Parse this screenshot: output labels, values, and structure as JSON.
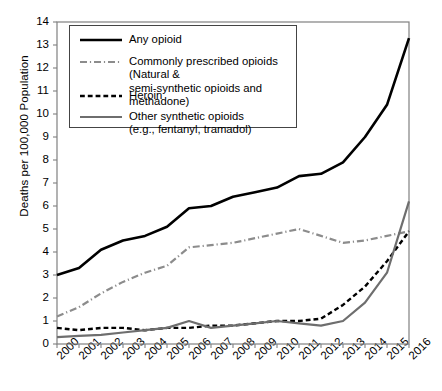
{
  "chart_data": {
    "type": "line",
    "title": "",
    "xlabel": "",
    "ylabel": "Deaths per 100,000 Population",
    "x": [
      2000,
      2001,
      2002,
      2003,
      2004,
      2005,
      2006,
      2007,
      2008,
      2009,
      2010,
      2011,
      2012,
      2013,
      2014,
      2015,
      2016
    ],
    "categories": [
      "2000",
      "2001",
      "2002",
      "2003",
      "2004",
      "2005",
      "2006",
      "2007",
      "2008",
      "2009",
      "2010",
      "2011",
      "2012",
      "2013",
      "2014",
      "2015",
      "2016"
    ],
    "ylim": [
      0,
      14
    ],
    "xlim": [
      2000,
      2016
    ],
    "yticks": [
      0,
      1,
      2,
      3,
      4,
      5,
      6,
      7,
      8,
      9,
      10,
      11,
      12,
      13,
      14
    ],
    "ytick_labels": [
      "0",
      "1",
      "2",
      "3",
      "4",
      "5",
      "6",
      "7",
      "8",
      "9",
      "10",
      "11",
      "12",
      "13",
      "14"
    ],
    "grid": false,
    "legend_position": "upper-left-inside",
    "series": [
      {
        "name": "Any opioid",
        "label": "Any opioid",
        "style": "solid",
        "color": "#000000",
        "width": 2.6,
        "values": [
          3.0,
          3.3,
          4.1,
          4.5,
          4.7,
          5.1,
          5.9,
          6.0,
          6.4,
          6.6,
          6.8,
          7.3,
          7.4,
          7.9,
          9.0,
          10.4,
          13.3
        ]
      },
      {
        "name": "Commonly prescribed opioids",
        "label": "Commonly prescribed opioids (Natural &\nsemi-synthetic opioids and methadone)",
        "style": "dash-dot",
        "color": "#8c8c8c",
        "width": 2.2,
        "values": [
          1.2,
          1.6,
          2.2,
          2.7,
          3.1,
          3.4,
          4.2,
          4.3,
          4.4,
          4.6,
          4.8,
          5.0,
          4.7,
          4.4,
          4.5,
          4.7,
          4.9
        ]
      },
      {
        "name": "Heroin",
        "label": "Heroin",
        "style": "dashed",
        "color": "#000000",
        "width": 2.4,
        "values": [
          0.7,
          0.6,
          0.7,
          0.7,
          0.6,
          0.7,
          0.7,
          0.8,
          0.8,
          0.9,
          1.0,
          1.0,
          1.1,
          1.7,
          2.5,
          3.6,
          4.9
        ]
      },
      {
        "name": "Other synthetic opioids",
        "label": "Other synthetic opioids\n(e.g., fentanyl, tramadol)",
        "style": "solid",
        "color": "#6e6e6e",
        "width": 2.2,
        "values": [
          0.3,
          0.35,
          0.4,
          0.5,
          0.6,
          0.7,
          1.0,
          0.7,
          0.8,
          0.9,
          1.0,
          0.9,
          0.8,
          1.0,
          1.8,
          3.1,
          6.2
        ]
      }
    ]
  },
  "axes": {
    "y_axis_title": "Deaths per 100,000 Population"
  }
}
